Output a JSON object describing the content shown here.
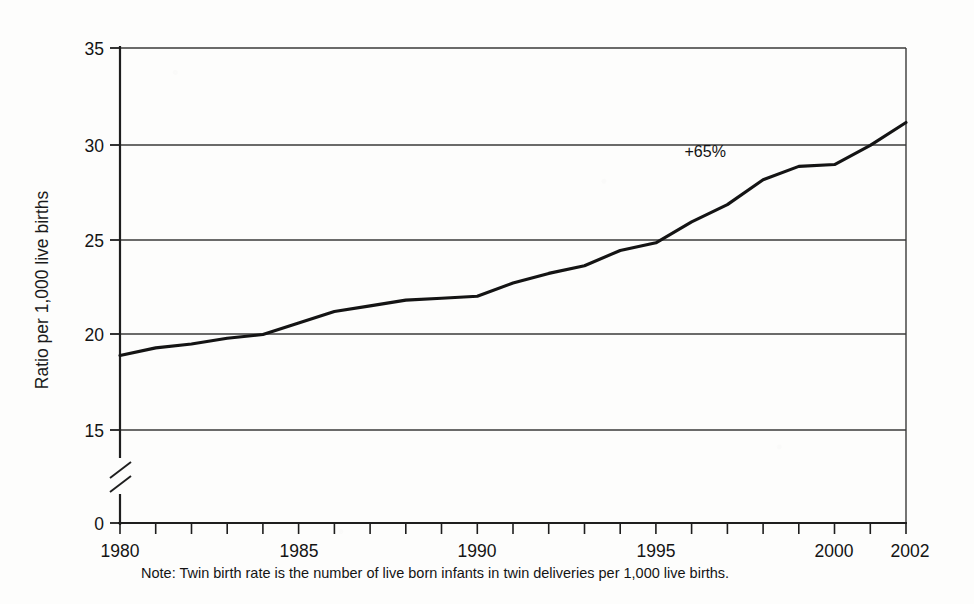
{
  "chart_data": {
    "type": "line",
    "title": "",
    "xlabel": "",
    "ylabel": "Ratio per 1,000 live births",
    "x": [
      1980,
      1981,
      1982,
      1983,
      1984,
      1985,
      1986,
      1987,
      1988,
      1989,
      1990,
      1991,
      1992,
      1993,
      1994,
      1995,
      1996,
      1997,
      1998,
      1999,
      2000,
      2001,
      2002
    ],
    "values": [
      18.9,
      19.3,
      19.5,
      19.8,
      20.0,
      20.6,
      21.2,
      21.5,
      21.8,
      21.9,
      22.0,
      22.7,
      23.2,
      23.6,
      24.4,
      24.8,
      25.9,
      26.8,
      28.1,
      28.8,
      28.9,
      29.9,
      31.1
    ],
    "series": [
      {
        "name": "Twin birth rate",
        "values": [
          18.9,
          19.3,
          19.5,
          19.8,
          20.0,
          20.6,
          21.2,
          21.5,
          21.8,
          21.9,
          22.0,
          22.7,
          23.2,
          23.6,
          24.4,
          24.8,
          25.9,
          26.8,
          28.1,
          28.8,
          28.9,
          29.9,
          31.1
        ]
      }
    ],
    "xlim": [
      1980,
      2002
    ],
    "ylim": [
      0,
      35
    ],
    "y_ticks": [
      0,
      15,
      20,
      25,
      30,
      35
    ],
    "y_tick_labels": [
      "0",
      "15",
      "20",
      "25",
      "30",
      "35"
    ],
    "x_ticks": [
      1980,
      1985,
      1990,
      1995,
      2000,
      2002
    ],
    "x_tick_labels": [
      "1980",
      "1985",
      "1990",
      "1995",
      "2000",
      "2002"
    ],
    "x_minor_tick_interval": 1,
    "grid": "horizontal",
    "legend": "none",
    "y_axis_break": true,
    "y_axis_break_between": [
      0,
      15
    ],
    "annotations": [
      {
        "text": "+65%",
        "x": 1995.8,
        "y": 29.3
      }
    ],
    "line_color": "#141414",
    "grid_color": "#3a3a3a",
    "background_color": "#fdfdfc"
  },
  "footnote": {
    "text": "Note: Twin birth rate is the number of live born infants in twin deliveries per 1,000 live births."
  }
}
